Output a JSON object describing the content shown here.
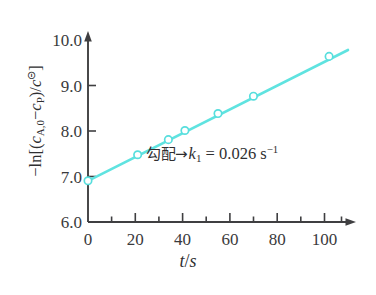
{
  "chart_data": {
    "type": "line",
    "title": "",
    "subtitle": "",
    "xlabel": "t/s",
    "ylabel": "-ln[(c_A,0 - c_P)/c^⊝]",
    "xlim": [
      0,
      110
    ],
    "ylim": [
      6.0,
      10.0
    ],
    "grid": false,
    "legend": "none",
    "x": [
      0,
      21,
      34,
      41,
      55,
      70,
      102
    ],
    "y": [
      6.9,
      7.47,
      7.8,
      8.0,
      8.37,
      8.75,
      9.62
    ],
    "series": [
      {
        "name": "-ln[(c_A,0 - c_P)/c^⊝] vs t",
        "x": [
          0,
          21,
          34,
          41,
          55,
          70,
          102
        ],
        "values": [
          6.9,
          7.47,
          7.8,
          8.0,
          8.37,
          8.75,
          9.62
        ],
        "marker": "open-circle",
        "color": "#5fe3e0"
      }
    ],
    "fit_line": {
      "intercept": 6.9,
      "slope": 0.026,
      "x_start": 0,
      "x_end": 110
    },
    "annotations": [
      {
        "text": "勾配→k₁ = 0.026 s⁻¹",
        "x": 34,
        "y": 7.63
      }
    ]
  },
  "axes": {
    "x": {
      "title": "t/s",
      "title_parts": {
        "variable": "t",
        "slash": "/",
        "unit": "s"
      },
      "tick_labels": [
        "0",
        "20",
        "40",
        "60",
        "80",
        "100"
      ],
      "tick_values": [
        0,
        20,
        40,
        60,
        80,
        100
      ],
      "minor_tick_values": [
        10,
        30,
        50,
        70,
        90,
        110
      ],
      "min": 0,
      "max": 110
    },
    "y": {
      "title": "-ln[(c_A,0 - c_P)/c^⊝]",
      "title_parts": {
        "minus": "−",
        "ln": "ln",
        "open_bracket": "[",
        "open_paren": "(",
        "c1": "c",
        "c1_sub": "A,0",
        "minus_inner": "−",
        "c2": "c",
        "c2_sub": "P",
        "close_paren": ")",
        "slash": "/",
        "c3": "c",
        "c3_sup": "⊝",
        "close_bracket": "]"
      },
      "tick_labels": [
        "6.0",
        "7.0",
        "8.0",
        "9.0",
        "10.0"
      ],
      "tick_values": [
        6.0,
        7.0,
        8.0,
        9.0,
        10.0
      ],
      "min": 6.0,
      "max": 10.0
    }
  },
  "annotation": {
    "cjk_text": "勾配",
    "arrow": "→",
    "symbol": "k",
    "symbol_sub": "1",
    "equals": "=",
    "value": "0.026",
    "unit": "s",
    "unit_sup": "−1",
    "full_text": "勾配→k₁ = 0.026 s⁻¹"
  },
  "colors": {
    "line": "#5fe3e0",
    "marker_stroke": "#57dedd",
    "marker_fill": "#ffffff",
    "axis": "#3f3f41",
    "text": "#2f2f31",
    "background": "#ffffff"
  }
}
